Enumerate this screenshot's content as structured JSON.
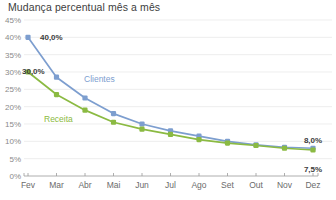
{
  "chart_data": {
    "type": "line",
    "title": "Mudança percentual mês a mês",
    "xlabel": "",
    "ylabel": "",
    "categories": [
      "Fev",
      "Mar",
      "Abr",
      "Mai",
      "Jun",
      "Jul",
      "Ago",
      "Set",
      "Out",
      "Nov",
      "Dez"
    ],
    "ylim": [
      0,
      45
    ],
    "ytick_labels": [
      "45%",
      "40%",
      "35%",
      "30%",
      "25%",
      "20%",
      "15%",
      "10%",
      "5%",
      "0%"
    ],
    "ytick_values": [
      45,
      40,
      35,
      30,
      25,
      20,
      15,
      10,
      5,
      0
    ],
    "grid": true,
    "legend_position": "inline",
    "series": [
      {
        "name": "Clientes",
        "color": "#7d9ecf",
        "values": [
          40.0,
          28.5,
          22.5,
          18.0,
          15.0,
          13.0,
          11.5,
          10.0,
          9.0,
          8.3,
          8.0
        ],
        "label_x": 11,
        "label_y": 13.5
      },
      {
        "name": "Receita",
        "color": "#8bba42",
        "values": [
          30.0,
          23.5,
          19.0,
          15.5,
          13.5,
          12.0,
          10.5,
          9.5,
          8.8,
          8.0,
          7.5
        ],
        "label_x": 6,
        "label_y": 4.6
      }
    ],
    "annotations": [
      {
        "text": "40,0%",
        "series": "Clientes",
        "point": "Fev",
        "value": 40.0
      },
      {
        "text": "30,0%",
        "series": "Receita",
        "point": "Fev",
        "value": 30.0
      },
      {
        "text": "8,0%",
        "series": "Clientes",
        "point": "Dez",
        "value": 8.0
      },
      {
        "text": "7,5%",
        "series": "Receita",
        "point": "Dez",
        "value": 7.5
      }
    ]
  },
  "colors": {
    "clientes": "#7d9ecf",
    "receita": "#8bba42",
    "grid": "#e6e6e6",
    "axis": "#9a9a9a",
    "title_text": "#404040",
    "ytick_text": "#8a8a8a",
    "xtick_text": "#6b6b6b",
    "annotation_text": "#3d3d3d"
  }
}
